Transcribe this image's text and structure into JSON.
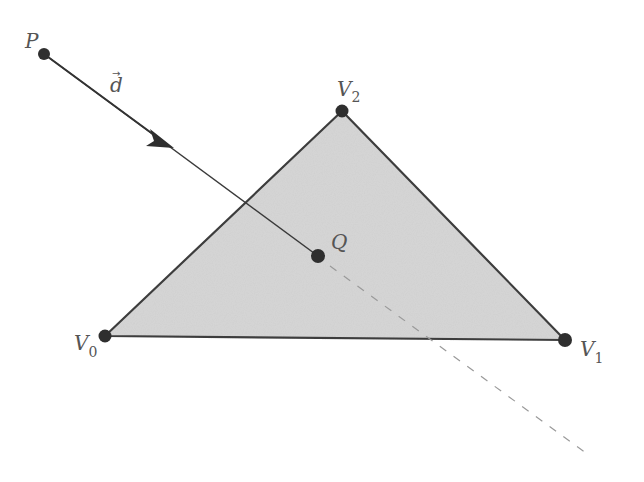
{
  "diagram": {
    "points": {
      "P": {
        "label": "P",
        "x": 44,
        "y": 54
      },
      "V0": {
        "label": "V",
        "sub": "0",
        "x": 105,
        "y": 336
      },
      "V1": {
        "label": "V",
        "sub": "1",
        "x": 565,
        "y": 340
      },
      "V2": {
        "label": "V",
        "sub": "2",
        "x": 342,
        "y": 111
      },
      "Q": {
        "label": "Q",
        "x": 318,
        "y": 256
      }
    },
    "direction_label": "d",
    "direction_arrow": "→",
    "colors": {
      "triangle_fill": "#d4d4d4",
      "triangle_stroke": "#444444",
      "point": "#2f2f2f",
      "ray": "#555555",
      "dashed": "#999999"
    }
  }
}
